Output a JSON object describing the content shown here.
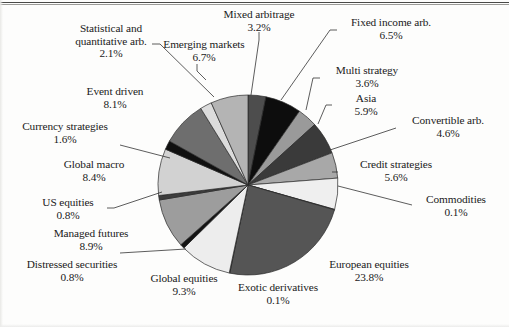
{
  "chart_data": {
    "type": "pie",
    "title": "",
    "subtitle": "",
    "xlabel": "",
    "ylabel": "",
    "legend_position": "none",
    "grid": false,
    "value_unit": "%",
    "categories": [
      "Mixed arbitrage",
      "Fixed income arb.",
      "Multi strategy",
      "Asia",
      "Convertible arb.",
      "Credit strategies",
      "Commodities",
      "European equities",
      "Exotic derivatives",
      "Global equities",
      "Distressed securities",
      "Managed futures",
      "US equities",
      "Global macro",
      "Currency strategies",
      "Event driven",
      "Statistical and quantitative arb.",
      "Emerging markets"
    ],
    "values": [
      3.2,
      6.5,
      3.6,
      5.9,
      4.6,
      5.6,
      0.1,
      23.8,
      0.1,
      9.3,
      0.8,
      8.9,
      0.8,
      8.4,
      1.6,
      8.1,
      2.1,
      6.7
    ],
    "slices": [
      {
        "label": "Mixed arbitrage",
        "value": 3.2,
        "pct_text": "3.2%",
        "color": "#4d4d4d"
      },
      {
        "label": "Fixed income arb.",
        "value": 6.5,
        "pct_text": "6.5%",
        "color": "#0d0d0d"
      },
      {
        "label": "Multi strategy",
        "value": 3.6,
        "pct_text": "3.6%",
        "color": "#9a9a9a"
      },
      {
        "label": "Asia",
        "value": 5.9,
        "pct_text": "5.9%",
        "color": "#3a3a3a"
      },
      {
        "label": "Convertible arb.",
        "value": 4.6,
        "pct_text": "4.6%",
        "color": "#a8a8a8"
      },
      {
        "label": "Credit strategies",
        "value": 5.6,
        "pct_text": "5.6%",
        "color": "#efefef"
      },
      {
        "label": "Commodities",
        "value": 0.1,
        "pct_text": "0.1%",
        "color": "#7a7a7a"
      },
      {
        "label": "European equities",
        "value": 23.8,
        "pct_text": "23.8%",
        "color": "#555555"
      },
      {
        "label": "Exotic derivatives",
        "value": 0.1,
        "pct_text": "0.1%",
        "color": "#2b2b2b"
      },
      {
        "label": "Global equities",
        "value": 9.3,
        "pct_text": "9.3%",
        "color": "#ededed"
      },
      {
        "label": "Distressed securities",
        "value": 0.8,
        "pct_text": "0.8%",
        "color": "#141414"
      },
      {
        "label": "Managed futures",
        "value": 8.9,
        "pct_text": "8.9%",
        "color": "#9d9d9d"
      },
      {
        "label": "US equities",
        "value": 0.8,
        "pct_text": "0.8%",
        "color": "#3d3d3d"
      },
      {
        "label": "Global macro",
        "value": 8.4,
        "pct_text": "8.4%",
        "color": "#d2d2d2"
      },
      {
        "label": "Currency strategies",
        "value": 1.6,
        "pct_text": "1.6%",
        "color": "#101010"
      },
      {
        "label": "Event driven",
        "value": 8.1,
        "pct_text": "8.1%",
        "color": "#6e6e6e"
      },
      {
        "label": "Statistical and quantitative arb.",
        "value": 2.1,
        "pct_text": "2.1%",
        "color": "#dcdcdc"
      },
      {
        "label": "Emerging markets",
        "value": 6.7,
        "pct_text": "6.7%",
        "color": "#b4b4b4"
      }
    ]
  },
  "labels": {
    "statistical": {
      "line1": "Statistical and",
      "line2": "quantitative arb.",
      "pct": "2.1%"
    },
    "emerging": {
      "line1": "Emerging markets",
      "pct": "6.7%"
    },
    "mixed": {
      "line1": "Mixed arbitrage",
      "pct": "3.2%"
    },
    "fixed": {
      "line1": "Fixed income arb.",
      "pct": "6.5%"
    },
    "multi": {
      "line1": "Multi strategy",
      "pct": "3.6%"
    },
    "asia": {
      "line1": "Asia",
      "pct": "5.9%"
    },
    "convertible": {
      "line1": "Convertible arb.",
      "pct": "4.6%"
    },
    "credit": {
      "line1": "Credit strategies",
      "pct": "5.6%"
    },
    "commodities": {
      "line1": "Commodities",
      "pct": "0.1%"
    },
    "european": {
      "line1": "European equities",
      "pct": "23.8%"
    },
    "exotic": {
      "line1": "Exotic derivatives",
      "pct": "0.1%"
    },
    "global_eq": {
      "line1": "Global equities",
      "pct": "9.3%"
    },
    "distressed": {
      "line1": "Distressed securities",
      "pct": "0.8%"
    },
    "managed": {
      "line1": "Managed futures",
      "pct": "8.9%"
    },
    "us_eq": {
      "line1": "US equities",
      "pct": "0.8%"
    },
    "global_macro": {
      "line1": "Global macro",
      "pct": "8.4%"
    },
    "currency": {
      "line1": "Currency strategies",
      "pct": "1.6%"
    },
    "event": {
      "line1": "Event driven",
      "pct": "8.1%"
    }
  },
  "geometry": {
    "cx": 248,
    "cy": 185,
    "r": 90
  }
}
